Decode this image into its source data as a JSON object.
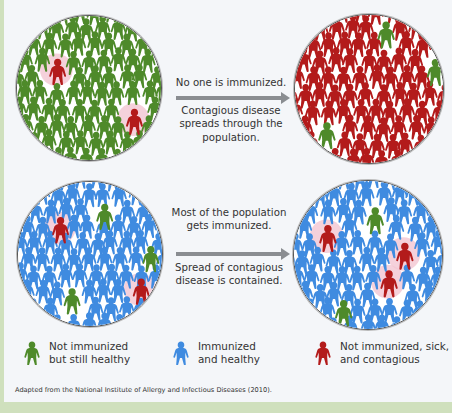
{
  "scenarios": [
    {
      "id": "no-immunization",
      "before_circle": {
        "majority_color": "green",
        "sick_count": 2
      },
      "after_circle": {
        "majority_color": "red",
        "healthy_count": 3
      },
      "caption_top": "No one is immunized.",
      "caption_bottom": "Contagious disease spreads through the population."
    },
    {
      "id": "mass-immunization",
      "before_circle": {
        "majority_color": "blue",
        "sick_count": 2,
        "not_immunized_healthy_count": 3
      },
      "after_circle": {
        "majority_color": "blue",
        "sick_count": 3,
        "not_immunized_healthy_count": 2
      },
      "caption_top": "Most of the population gets immunized.",
      "caption_bottom": "Spread of contagious disease is contained."
    }
  ],
  "legend": [
    {
      "icon": "person-green-icon",
      "color": "#4e8a2a",
      "line1": "Not immunized",
      "line2": "but still healthy"
    },
    {
      "icon": "person-blue-icon",
      "color": "#3f8be0",
      "line1": "Immunized",
      "line2": "and healthy"
    },
    {
      "icon": "person-red-icon",
      "color": "#b31b1b",
      "line1": "Not immunized, sick,",
      "line2": "and contagious"
    }
  ],
  "source": "Adapted from the National Institute of Allergy and Infectious Diseases (2010).",
  "colors": {
    "green": "#4e8a2a",
    "blue": "#3f8be0",
    "red": "#b31b1b",
    "halo": "#f2c6d2",
    "arrow": "#8a8d91",
    "frame": "#cfe0bd",
    "background": "#f4f6f9"
  }
}
